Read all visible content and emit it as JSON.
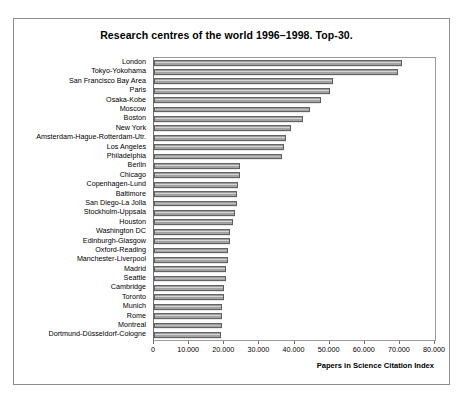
{
  "chart_data": {
    "type": "bar",
    "orientation": "horizontal",
    "title": "Research centres of the world 1996–1998. Top-30.",
    "xlabel": "Papers in Science Citation Index",
    "ylabel": "",
    "xlim": [
      0,
      80000
    ],
    "xticks": [
      0,
      10000,
      20000,
      30000,
      40000,
      50000,
      60000,
      70000,
      80000
    ],
    "xticklabels": [
      "0",
      "10.000",
      "20.000",
      "30.000",
      "40.000",
      "50.000",
      "60.000",
      "70.000",
      "80.000"
    ],
    "grid": false,
    "legend": null,
    "bar_color": "#a3a3a3",
    "bar_edge_color": "#5d5d5d",
    "categories": [
      "London",
      "Tokyo-Yokohama",
      "San Francisco Bay Area",
      "Paris",
      "Osaka-Kobe",
      "Moscow",
      "Boston",
      "New York",
      "Amsterdam-Hague-Rotterdam-Utr.",
      "Los Angeles",
      "Philadelphia",
      "Berlin",
      "Chicago",
      "Copenhagen-Lund",
      "Baltimore",
      "San Diego-La Jolla",
      "Stockholm-Uppsala",
      "Houston",
      "Washington DC",
      "Edinburgh-Glasgow",
      "Oxford-Reading",
      "Manchester-Liverpool",
      "Madrid",
      "Seattle",
      "Cambridge",
      "Toronto",
      "Munich",
      "Rome",
      "Montreal",
      "Dortmund-Düsseldorf-Cologne"
    ],
    "values": [
      70500,
      69500,
      51000,
      50000,
      47500,
      44500,
      42500,
      39000,
      37500,
      37000,
      36500,
      24500,
      24500,
      24000,
      23500,
      23500,
      23000,
      22500,
      21500,
      21500,
      21000,
      21000,
      20500,
      20500,
      20000,
      20000,
      19500,
      19500,
      19500,
      19000
    ]
  }
}
